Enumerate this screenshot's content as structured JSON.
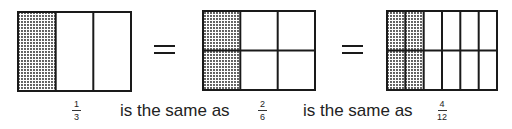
{
  "figures": [
    {
      "id": "one-third",
      "rows": 1,
      "cols": 3,
      "shaded_cols": 1,
      "x": 18,
      "y": 12,
      "w": 113,
      "h": 79,
      "numerator": "1",
      "denominator": "3"
    },
    {
      "id": "two-sixths",
      "rows": 2,
      "cols": 3,
      "shaded_cols": 1,
      "x": 203,
      "y": 11,
      "w": 112,
      "h": 79,
      "numerator": "2",
      "denominator": "6"
    },
    {
      "id": "four-twelfths",
      "rows": 2,
      "cols": 6,
      "shaded_cols": 2,
      "x": 387,
      "y": 11,
      "w": 110,
      "h": 79,
      "numerator": "4",
      "denominator": "12"
    }
  ],
  "equals": [
    "=",
    "="
  ],
  "phrases": [
    "is the same as",
    "is the same as"
  ],
  "colors": {
    "stroke": "#1a1a1a",
    "shade_dot": "#1a1a1a",
    "background": "#ffffff"
  }
}
